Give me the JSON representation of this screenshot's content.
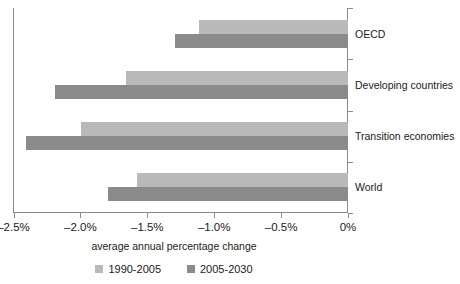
{
  "chart_data": {
    "type": "bar",
    "orientation": "horizontal",
    "title": "",
    "xlabel": "average annual percentage change",
    "ylabel": "",
    "categories": [
      "OECD",
      "Developing countries",
      "Transition economies",
      "World"
    ],
    "series": [
      {
        "name": "1990-2005",
        "color": "#b9b9b9",
        "values": [
          -1.12,
          -1.66,
          -2.0,
          -1.58
        ]
      },
      {
        "name": "2005-2030",
        "color": "#8b8b8b",
        "values": [
          -1.3,
          -2.19,
          -2.41,
          -1.8
        ]
      }
    ],
    "xlim": [
      -2.5,
      0
    ],
    "xticks": [
      -2.5,
      -2.0,
      -1.5,
      -1.0,
      -0.5,
      0
    ],
    "xtick_labels": [
      "–2.5%",
      "–2.0%",
      "–1.5%",
      "–1.0%",
      "–0.5%",
      "0%"
    ],
    "grid": false,
    "legend_position": "bottom"
  },
  "axis": {
    "title": "average annual percentage change"
  },
  "legend": {
    "items": [
      {
        "label": "1990-2005",
        "swatch": "light-gray-swatch"
      },
      {
        "label": "2005-2030",
        "swatch": "dark-gray-swatch"
      }
    ]
  },
  "colors": {
    "series_a": "#b9b9b9",
    "series_b": "#8b8b8b",
    "axis": "#8c8c8c",
    "text": "#1a1a1a",
    "background": "#ffffff"
  }
}
